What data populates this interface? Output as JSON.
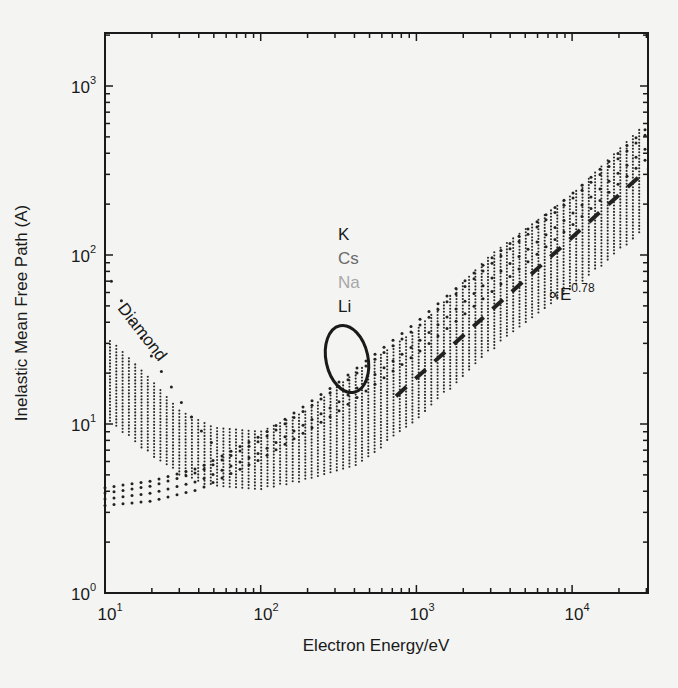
{
  "chart_data": {
    "type": "scatter",
    "title": "",
    "xlabel": "Electron Energy/eV",
    "ylabel": "Inelastic Mean Free Path (A)",
    "xscale": "log",
    "yscale": "log",
    "xlim": [
      10,
      31000
    ],
    "ylim": [
      1,
      2000
    ],
    "x_ticks": [
      {
        "value": 10,
        "label_base": "10",
        "label_exp": "1"
      },
      {
        "value": 100,
        "label_base": "10",
        "label_exp": "2"
      },
      {
        "value": 1000,
        "label_base": "10",
        "label_exp": "3"
      },
      {
        "value": 10000,
        "label_base": "10",
        "label_exp": "4"
      }
    ],
    "y_ticks": [
      {
        "value": 1,
        "label_base": "10",
        "label_exp": "0"
      },
      {
        "value": 10,
        "label_base": "10",
        "label_exp": "1"
      },
      {
        "value": 100,
        "label_base": "10",
        "label_exp": "2"
      },
      {
        "value": 1000,
        "label_base": "10",
        "label_exp": "3"
      }
    ],
    "grid": false,
    "legend": null,
    "series": [
      {
        "name": "Elements band (upper envelope)",
        "style": "dotted band",
        "x": [
          11,
          20,
          30,
          50,
          100,
          200,
          400,
          1000,
          3000,
          10000,
          27000
        ],
        "y": [
          31,
          18,
          12,
          9.5,
          9,
          12,
          20,
          36,
          100,
          227,
          550
        ]
      },
      {
        "name": "Elements band (lower envelope)",
        "style": "dotted band",
        "x": [
          11,
          20,
          30,
          50,
          100,
          200,
          400,
          1000,
          3000,
          10000,
          27000
        ],
        "y": [
          10,
          6.5,
          5,
          4.2,
          4.1,
          4.6,
          5.5,
          10.5,
          27,
          62,
          132
        ]
      },
      {
        "name": "K",
        "style": "dotted",
        "x": [
          10,
          20,
          40,
          100,
          300,
          1000,
          3000,
          10000,
          30000
        ],
        "y": [
          4.2,
          4.6,
          5.5,
          8.5,
          17,
          40,
          95,
          230,
          560
        ]
      },
      {
        "name": "Cs",
        "style": "dotted",
        "x": [
          10,
          20,
          40,
          100,
          300,
          1000,
          3000,
          10000,
          30000
        ],
        "y": [
          3.9,
          4.3,
          5.2,
          8,
          16,
          37,
          88,
          215,
          520
        ]
      },
      {
        "name": "Na",
        "style": "dotted",
        "x": [
          10,
          20,
          40,
          100,
          300,
          1000,
          3000,
          10000,
          30000
        ],
        "y": [
          3.6,
          3.9,
          4.6,
          6.8,
          13,
          30,
          72,
          175,
          430
        ]
      },
      {
        "name": "Li",
        "style": "dotted",
        "x": [
          10,
          20,
          40,
          100,
          300,
          1000,
          3000,
          10000,
          30000
        ],
        "y": [
          3.3,
          3.5,
          4.1,
          6.2,
          11.5,
          26,
          60,
          150,
          370
        ]
      },
      {
        "name": "Diamond",
        "style": "dotted",
        "x": [
          11,
          15,
          20,
          30,
          40,
          50
        ],
        "y": [
          70,
          40,
          25,
          14,
          9.5,
          7.5
        ]
      },
      {
        "name": "∝E^0.78",
        "style": "dashed",
        "x": [
          740,
          31000
        ],
        "y": [
          14.6,
          320
        ]
      }
    ],
    "annotations": [
      {
        "text": "Diamond",
        "rotation_deg": 52,
        "color": "#1a1a1a"
      },
      {
        "text": "K",
        "color": "#1a1a1a"
      },
      {
        "text": "Cs",
        "color": "#6a6a6a"
      },
      {
        "text": "Na",
        "color": "#a8a8a8"
      },
      {
        "text": "Li",
        "color": "#1a1a1a"
      },
      {
        "text": "∝E",
        "superscript": "0.78",
        "color": "#1a1a1a"
      },
      {
        "shape": "ellipse",
        "note": "circles alkali-metal curves near 300–500 eV"
      }
    ]
  },
  "labels": {
    "x_title": "Electron Energy/eV",
    "y_title": "Inelastic Mean Free Path (A)",
    "diamond": "Diamond",
    "k": "K",
    "cs": "Cs",
    "na": "Na",
    "li": "Li",
    "power_base": "∝E",
    "power_exp": "0.78",
    "ten": "10",
    "exp0": "0",
    "exp1": "1",
    "exp2": "2",
    "exp3": "3",
    "exp4": "4"
  },
  "colors": {
    "background": "#f4f4f2",
    "ink": "#1a1a1a",
    "cs": "#6a6a6a",
    "na": "#a8a8a8"
  }
}
